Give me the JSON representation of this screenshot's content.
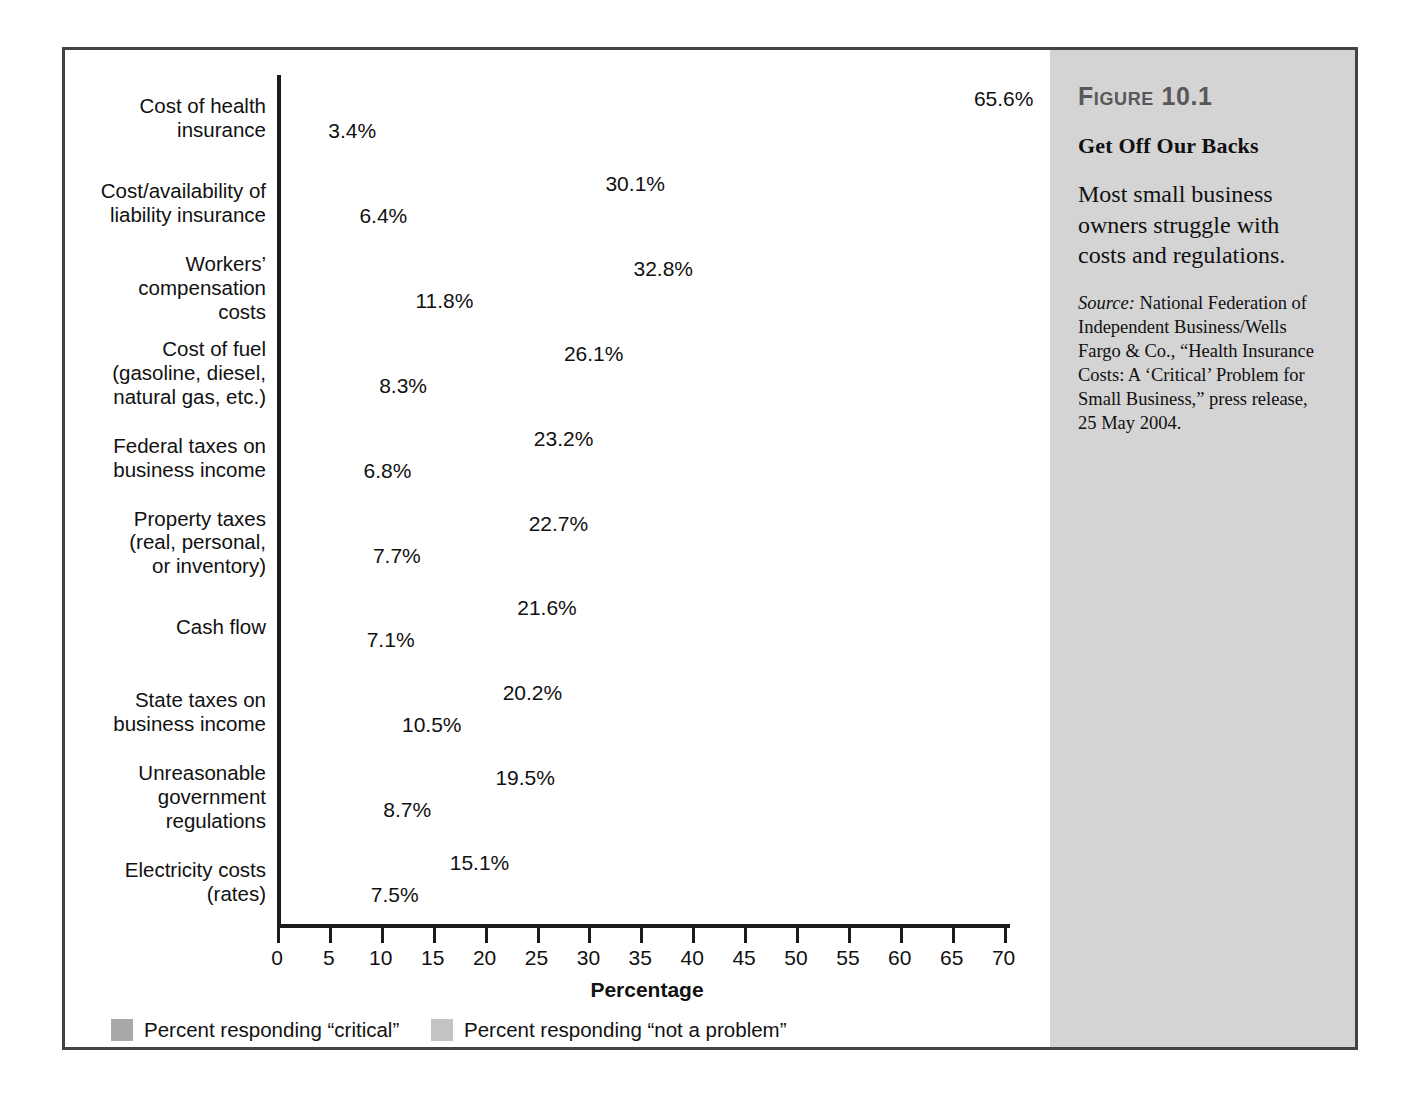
{
  "figure": {
    "number": "Figure 10.1",
    "title": "Get Off Our Backs",
    "body": "Most small business owners struggle with costs and regulations.",
    "source_label": "Source:",
    "source_text": " National Federation of Independent Business/Wells Fargo & Co., “Health Insurance Costs: A ‘Critical’ Problem for Small Business,” press release, 25 May 2004."
  },
  "colors": {
    "critical_bar": "#a9a9a9",
    "critical_shadow": "#5f5f5f",
    "notproblem_bar": "#c3c3c3",
    "notproblem_shadow": "#6b6b6b",
    "panel_background": "#d4d4d4",
    "frame_border": "#434343",
    "axis": "#1b1b1b",
    "text": "#111111",
    "figure_number": "#58585a"
  },
  "chart_data": {
    "type": "bar",
    "orientation": "horizontal",
    "title": "Get Off Our Backs",
    "xlabel": "Percentage",
    "ylabel": "",
    "xlim": [
      0,
      70
    ],
    "xticks": [
      0,
      5,
      10,
      15,
      20,
      25,
      30,
      35,
      40,
      45,
      50,
      55,
      60,
      65,
      70
    ],
    "grid": false,
    "legend_position": "bottom-left",
    "categories": [
      "Cost of health insurance",
      "Cost/availability of liability insurance",
      "Workers’ compensation costs",
      "Cost of fuel (gasoline, diesel, natural gas, etc.)",
      "Federal taxes on business income",
      "Property taxes (real, personal, or inventory)",
      "Cash flow",
      "State taxes on business income",
      "Unreasonable government regulations",
      "Electricity costs (rates)"
    ],
    "category_lines": [
      [
        "Cost of health",
        "insurance"
      ],
      [
        "Cost/availability of",
        "liability insurance"
      ],
      [
        "Workers’",
        "compensation",
        "costs"
      ],
      [
        "Cost of fuel",
        "(gasoline, diesel,",
        "natural gas, etc.)"
      ],
      [
        "Federal taxes on",
        "business income"
      ],
      [
        "Property taxes",
        "(real, personal,",
        "or inventory)"
      ],
      [
        "Cash flow"
      ],
      [
        "State taxes on",
        "business income"
      ],
      [
        "Unreasonable",
        "government",
        "regulations"
      ],
      [
        "Electricity costs",
        "(rates)"
      ]
    ],
    "series": [
      {
        "name": "Percent responding “critical”",
        "color": "#a9a9a9",
        "values": [
          65.6,
          30.1,
          32.8,
          26.1,
          23.2,
          22.7,
          21.6,
          20.2,
          19.5,
          15.1
        ],
        "labels": [
          "65.6%",
          "30.1%",
          "32.8%",
          "26.1%",
          "23.2%",
          "22.7%",
          "21.6%",
          "20.2%",
          "19.5%",
          "15.1%"
        ]
      },
      {
        "name": "Percent responding “not a problem”",
        "color": "#c3c3c3",
        "values": [
          3.4,
          6.4,
          11.8,
          8.3,
          6.8,
          7.7,
          7.1,
          10.5,
          8.7,
          7.5
        ],
        "labels": [
          "3.4%",
          "6.4%",
          "11.8%",
          "8.3%",
          "6.8%",
          "7.7%",
          "7.1%",
          "10.5%",
          "8.7%",
          "7.5%"
        ]
      }
    ]
  },
  "legend": [
    {
      "label": "Percent responding “critical”",
      "color": "#a9a9a9"
    },
    {
      "label": "Percent responding “not a problem”",
      "color": "#c3c3c3"
    }
  ]
}
